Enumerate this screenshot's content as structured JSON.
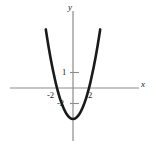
{
  "figure": {
    "name": "parabola-plot",
    "background_color": "#ffffff",
    "curve_color": "#1a1a1a",
    "axis_color": "#8c8c8c",
    "text_color": "#1a1a1a"
  },
  "chart_data": {
    "type": "line",
    "title": "",
    "subtitle": "",
    "xlabel": "x",
    "ylabel": "y",
    "legend": [],
    "grid": false,
    "xlim": [
      -3.8,
      4.0
    ],
    "ylim": [
      -4.6,
      4.6
    ],
    "x_ticks": [
      -2,
      2
    ],
    "x_tick_labels": [
      "-2",
      "2"
    ],
    "y_ticks": [
      1,
      -2
    ],
    "y_tick_labels": [
      "1",
      "-2"
    ],
    "annotations": [],
    "series": [
      {
        "name": "parabola",
        "equation": "y = 0.5*x^2 - 2",
        "vertex": [
          0,
          -2
        ],
        "roots": [
          -2,
          2
        ],
        "x": [
          -3.4,
          -3.0,
          -2.6,
          -2.2,
          -2.0,
          -1.6,
          -1.2,
          -0.8,
          -0.4,
          0.0,
          0.4,
          0.8,
          1.2,
          1.6,
          2.0,
          2.2,
          2.6,
          3.0,
          3.4
        ],
        "values": [
          3.78,
          2.5,
          1.38,
          0.42,
          0.0,
          -0.72,
          -1.28,
          -1.68,
          -1.92,
          -2.0,
          -1.92,
          -1.68,
          -1.28,
          -0.72,
          0.0,
          0.42,
          1.38,
          2.5,
          3.78
        ]
      }
    ]
  },
  "labels": {
    "y_axis": "y",
    "x_axis": "x",
    "x_neg2": "-2",
    "x_pos2": "2",
    "y_1": "1",
    "y_neg2": "-2"
  }
}
